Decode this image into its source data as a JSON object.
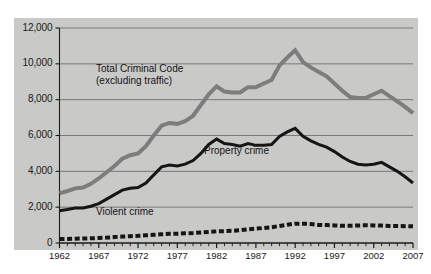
{
  "figure": {
    "background_color": "#ffffff",
    "panel_color": "#c9c9c7",
    "panel_rect": {
      "x": 14,
      "y": 18,
      "width": 404,
      "height": 232
    }
  },
  "chart_data": {
    "type": "line",
    "title": "",
    "subtitle": "",
    "xlabel": "",
    "ylabel": "",
    "xlim": [
      1962,
      2007
    ],
    "ylim": [
      0,
      12000
    ],
    "grid": "horizontal",
    "legend_position": "inline-annotations",
    "y_ticks": [
      0,
      2000,
      4000,
      6000,
      8000,
      10000,
      12000
    ],
    "y_tick_labels": [
      "0",
      "2,000",
      "4,000",
      "6,000",
      "8,000",
      "10,000",
      "12,000"
    ],
    "x_ticks": [
      1962,
      1967,
      1972,
      1977,
      1982,
      1987,
      1992,
      1997,
      2002,
      2007
    ],
    "x_tick_labels": [
      "1962",
      "1967",
      "1972",
      "1977",
      "1982",
      "1987",
      "1992",
      "1997",
      "2002",
      "2007"
    ],
    "x_minor_tick_interval": 1,
    "x": [
      1962,
      1963,
      1964,
      1965,
      1966,
      1967,
      1968,
      1969,
      1970,
      1971,
      1972,
      1973,
      1974,
      1975,
      1976,
      1977,
      1978,
      1979,
      1980,
      1981,
      1982,
      1983,
      1984,
      1985,
      1986,
      1987,
      1988,
      1989,
      1990,
      1991,
      1992,
      1993,
      1994,
      1995,
      1996,
      1997,
      1998,
      1999,
      2000,
      2001,
      2002,
      2003,
      2004,
      2005,
      2006,
      2007
    ],
    "series": [
      {
        "name": "Total Criminal Code (excluding traffic)",
        "color": "#7d7d7d",
        "style": "solid",
        "width": 4,
        "values": [
          2771,
          2900,
          3050,
          3100,
          3300,
          3600,
          3950,
          4300,
          4700,
          4900,
          5000,
          5400,
          6000,
          6550,
          6700,
          6650,
          6800,
          7100,
          7700,
          8300,
          8750,
          8450,
          8400,
          8400,
          8700,
          8700,
          8900,
          9100,
          9900,
          10350,
          10750,
          10100,
          9800,
          9550,
          9300,
          8900,
          8500,
          8150,
          8100,
          8100,
          8300,
          8500,
          8200,
          7900,
          7600,
          7250
        ]
      },
      {
        "name": "Property crime",
        "color": "#151515",
        "style": "solid",
        "width": 3,
        "values": [
          1800,
          1870,
          1950,
          1950,
          2050,
          2200,
          2450,
          2700,
          2950,
          3050,
          3100,
          3350,
          3800,
          4250,
          4350,
          4300,
          4400,
          4600,
          5000,
          5500,
          5800,
          5550,
          5500,
          5400,
          5550,
          5450,
          5450,
          5500,
          5950,
          6200,
          6400,
          5950,
          5700,
          5500,
          5350,
          5100,
          4800,
          4550,
          4400,
          4350,
          4400,
          4500,
          4250,
          4000,
          3700,
          3350
        ]
      },
      {
        "name": "Violent crime",
        "color": "#151515",
        "style": "dashed",
        "width": 4,
        "values": [
          220,
          230,
          240,
          250,
          260,
          280,
          300,
          330,
          360,
          380,
          400,
          430,
          460,
          490,
          510,
          520,
          540,
          560,
          590,
          620,
          650,
          660,
          680,
          710,
          760,
          800,
          840,
          880,
          950,
          1020,
          1080,
          1080,
          1060,
          1010,
          1000,
          980,
          960,
          960,
          980,
          990,
          980,
          970,
          950,
          950,
          940,
          930
        ]
      }
    ],
    "annotations": [
      {
        "id": "total-criminal-code-label",
        "text": "Total Criminal Code\n(excluding traffic)",
        "x": 96,
        "y": 63
      },
      {
        "id": "property-crime-label",
        "text": "Property crime",
        "x": 204,
        "y": 145
      },
      {
        "id": "violent-crime-label",
        "text": "Violent crime",
        "x": 96,
        "y": 206
      }
    ]
  }
}
